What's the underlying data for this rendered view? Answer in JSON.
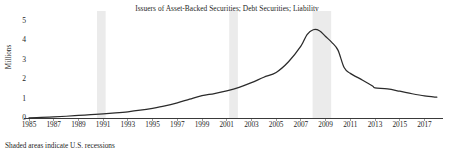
{
  "chart_data": {
    "type": "line",
    "title": "Issuers of Asset-Backed Securities; Debt Securities; Liability",
    "xlabel": "",
    "ylabel": "Millions",
    "ylim": [
      0,
      5
    ],
    "xlim": [
      1985,
      2018.5
    ],
    "grid": false,
    "legend": false,
    "footnote": "Shaded areas indicate U.S. recessions",
    "yticks": [
      0,
      1,
      2,
      3,
      4,
      5
    ],
    "ytick_labels": [
      "0",
      "1",
      "2",
      "3",
      "4",
      "5"
    ],
    "xticks": [
      1985,
      1987,
      1989,
      1991,
      1993,
      1995,
      1997,
      1999,
      2001,
      2003,
      2005,
      2007,
      2009,
      2011,
      2013,
      2015,
      2017
    ],
    "xtick_labels": [
      "1985",
      "1987",
      "1989",
      "1991",
      "1993",
      "1995",
      "1997",
      "1999",
      "2001",
      "2003",
      "2005",
      "2007",
      "2009",
      "2011",
      "2013",
      "2015",
      "2017"
    ],
    "line_color": "#2b2b2b",
    "recession_color": "#ebebeb",
    "recessions": [
      {
        "start": 1990.5,
        "end": 1991.2
      },
      {
        "start": 2001.2,
        "end": 2001.9
      },
      {
        "start": 2007.95,
        "end": 2009.45
      }
    ],
    "series": [
      {
        "name": "Issuers of Asset-Backed Securities; Debt Securities; Liability",
        "x": [
          1985,
          1986,
          1987,
          1988,
          1989,
          1990,
          1991,
          1992,
          1993,
          1994,
          1995,
          1996,
          1997,
          1998,
          1999,
          2000,
          2001,
          2002,
          2003,
          2004,
          2005,
          2006,
          2007,
          2007.5,
          2008,
          2008.5,
          2009,
          2009.5,
          2010,
          2010.5,
          2011,
          2012,
          2012.8,
          2013,
          2014,
          2015,
          2016,
          2017,
          2018
        ],
        "values": [
          0.01,
          0.03,
          0.06,
          0.09,
          0.13,
          0.17,
          0.21,
          0.26,
          0.32,
          0.4,
          0.5,
          0.62,
          0.78,
          0.97,
          1.15,
          1.26,
          1.4,
          1.58,
          1.82,
          2.1,
          2.35,
          2.9,
          3.7,
          4.3,
          4.55,
          4.5,
          4.2,
          3.9,
          3.5,
          2.6,
          2.3,
          1.95,
          1.65,
          1.55,
          1.5,
          1.38,
          1.25,
          1.14,
          1.07
        ]
      }
    ]
  }
}
